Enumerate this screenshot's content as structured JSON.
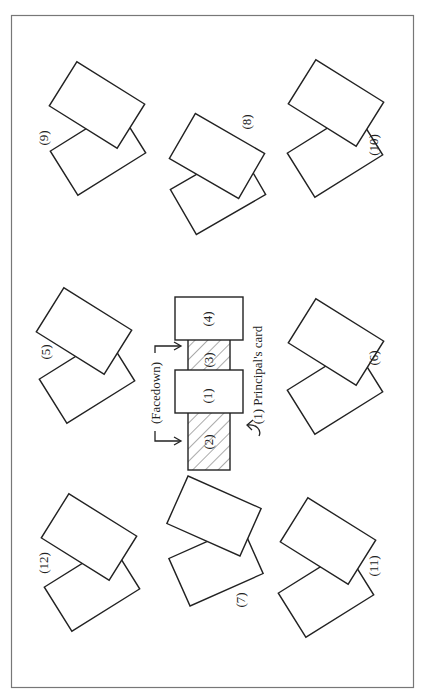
{
  "figure": {
    "orientation": "rotated-90-clockwise",
    "center": {
      "cards": [
        {
          "id": "1",
          "label": "(1)",
          "facedown": false
        },
        {
          "id": "2",
          "label": "(2)",
          "facedown": true
        },
        {
          "id": "3",
          "label": "(3)",
          "facedown": true
        },
        {
          "id": "4",
          "label": "(4)",
          "facedown": false
        }
      ],
      "facedown_label": "(Facedown)",
      "principal_label": "(1) Principal's card"
    },
    "pairs": [
      {
        "label": "(5)"
      },
      {
        "label": "(6)"
      },
      {
        "label": "(7)"
      },
      {
        "label": "(8)"
      },
      {
        "label": "(9)"
      },
      {
        "label": "(10)"
      },
      {
        "label": "(11)"
      },
      {
        "label": "(12)"
      }
    ]
  }
}
